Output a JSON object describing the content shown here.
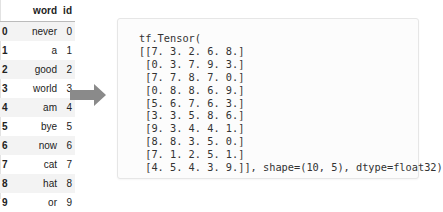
{
  "dataframe": {
    "columns": [
      "",
      "word",
      "id"
    ],
    "rows": [
      {
        "index": "0",
        "word": "never",
        "id": "0"
      },
      {
        "index": "1",
        "word": "a",
        "id": "1"
      },
      {
        "index": "2",
        "word": "good",
        "id": "2"
      },
      {
        "index": "3",
        "word": "world",
        "id": "3"
      },
      {
        "index": "4",
        "word": "am",
        "id": "4"
      },
      {
        "index": "5",
        "word": "bye",
        "id": "5"
      },
      {
        "index": "6",
        "word": "now",
        "id": "6"
      },
      {
        "index": "7",
        "word": "cat",
        "id": "7"
      },
      {
        "index": "8",
        "word": "hat",
        "id": "8"
      },
      {
        "index": "9",
        "word": "or",
        "id": "9"
      }
    ]
  },
  "arrow": {
    "icon": "right-arrow-icon",
    "color": "#8a8a8a"
  },
  "tensor_output": {
    "header": "tf.Tensor(",
    "rows": [
      "[[7. 3. 2. 6. 8.]",
      " [0. 3. 7. 9. 3.]",
      " [7. 7. 8. 7. 0.]",
      " [0. 8. 8. 6. 9.]",
      " [5. 6. 7. 6. 3.]",
      " [3. 3. 5. 8. 6.]",
      " [9. 3. 4. 4. 1.]",
      " [8. 8. 3. 5. 0.]",
      " [7. 1. 2. 5. 1.]",
      " [4. 5. 4. 3. 9.]], shape=(10, 5), dtype=float32)"
    ]
  }
}
